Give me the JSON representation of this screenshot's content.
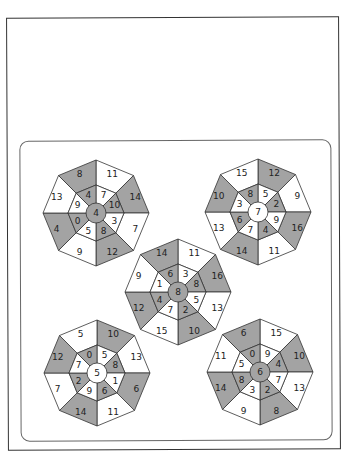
{
  "page": {
    "colors": {
      "shaded": "#a3a3a3",
      "unshaded": "#ffffff",
      "stroke": "#333333"
    }
  },
  "octagons": [
    {
      "id": "top-left",
      "cx": 96,
      "cy": 213,
      "center": "4",
      "inner": [
        "7",
        "10",
        "3",
        "8",
        "5",
        "0",
        "9",
        "4"
      ],
      "outer": [
        "11",
        "14",
        "7",
        "12",
        "9",
        "4",
        "13",
        "8"
      ],
      "outer_shaded": [
        false,
        true,
        false,
        true,
        false,
        true,
        false,
        true
      ],
      "inner_shaded": [
        false,
        true,
        false,
        true,
        false,
        true,
        false,
        true
      ]
    },
    {
      "id": "top-right",
      "cx": 258,
      "cy": 212,
      "center": "7",
      "inner": [
        "5",
        "2",
        "9",
        "4",
        "7",
        "6",
        "3",
        "8"
      ],
      "outer": [
        "12",
        "9",
        "16",
        "11",
        "14",
        "13",
        "10",
        "15"
      ],
      "outer_shaded": [
        true,
        false,
        true,
        false,
        true,
        false,
        true,
        false
      ],
      "inner_shaded": [
        false,
        true,
        false,
        true,
        false,
        true,
        false,
        true
      ]
    },
    {
      "id": "middle",
      "cx": 178,
      "cy": 292,
      "center": "8",
      "inner": [
        "3",
        "8",
        "5",
        "2",
        "7",
        "4",
        "1",
        "6"
      ],
      "outer": [
        "11",
        "16",
        "13",
        "10",
        "15",
        "12",
        "9",
        "14"
      ],
      "outer_shaded": [
        false,
        true,
        false,
        true,
        false,
        true,
        false,
        true
      ],
      "inner_shaded": [
        false,
        true,
        false,
        true,
        false,
        true,
        false,
        true
      ]
    },
    {
      "id": "bottom-left",
      "cx": 97,
      "cy": 373,
      "center": "5",
      "inner": [
        "5",
        "8",
        "1",
        "6",
        "9",
        "2",
        "7",
        "0"
      ],
      "outer": [
        "10",
        "13",
        "6",
        "11",
        "14",
        "7",
        "12",
        "5"
      ],
      "outer_shaded": [
        true,
        false,
        true,
        false,
        true,
        false,
        true,
        false
      ],
      "inner_shaded": [
        false,
        true,
        false,
        true,
        false,
        true,
        false,
        true
      ]
    },
    {
      "id": "bottom-right",
      "cx": 260,
      "cy": 372,
      "center": "6",
      "inner": [
        "9",
        "4",
        "7",
        "2",
        "3",
        "8",
        "5",
        "0"
      ],
      "outer": [
        "15",
        "10",
        "13",
        "8",
        "9",
        "14",
        "11",
        "6"
      ],
      "outer_shaded": [
        false,
        true,
        false,
        true,
        false,
        true,
        false,
        true
      ],
      "inner_shaded": [
        false,
        true,
        false,
        true,
        false,
        true,
        false,
        true
      ]
    }
  ]
}
